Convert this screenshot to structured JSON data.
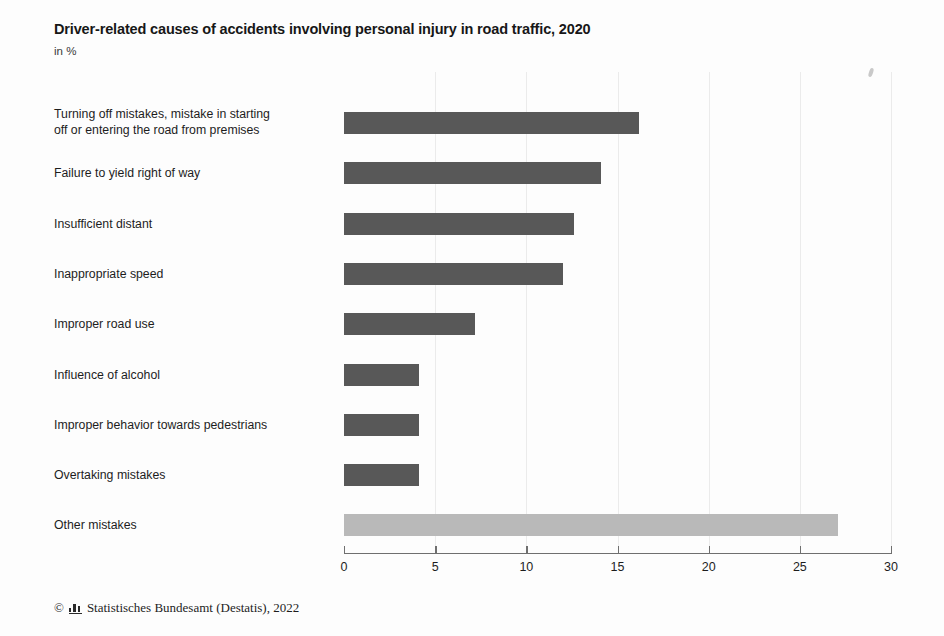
{
  "chart_data": {
    "type": "bar",
    "orientation": "horizontal",
    "title": "Driver-related causes of accidents involving personal injury in road traffic, 2020",
    "subtitle": "in %",
    "xlabel": "",
    "ylabel": "",
    "xlim": [
      0,
      30
    ],
    "xticks": [
      0,
      5,
      10,
      15,
      20,
      25,
      30
    ],
    "grid": true,
    "legend": "none",
    "categories": [
      "Turning off mistakes, mistake in starting off or entering the road from premises",
      "Failure to yield right of way",
      "Insufficient distant",
      "Inappropriate speed",
      "Improper road use",
      "Influence of alcohol",
      "Improper behavior towards pedestrians",
      "Overtaking mistakes",
      "Other mistakes"
    ],
    "values": [
      16.2,
      14.1,
      12.6,
      12.0,
      7.2,
      4.1,
      4.1,
      4.1,
      27.1
    ],
    "bar_colors": [
      "#585858",
      "#585858",
      "#585858",
      "#585858",
      "#585858",
      "#585858",
      "#585858",
      "#585858",
      "#b9b9b9"
    ]
  },
  "labels": {
    "line1": [
      "Turning off mistakes, mistake in starting",
      "Failure to yield right of way",
      "Insufficient distant",
      "Inappropriate speed",
      "Improper road use",
      "Influence of alcohol",
      "Improper behavior towards pedestrians",
      "Overtaking mistakes",
      "Other mistakes"
    ],
    "line2": [
      "off or entering the road from premises",
      "",
      "",
      "",
      "",
      "",
      "",
      "",
      ""
    ]
  },
  "axis": {
    "tick_labels": [
      "0",
      "5",
      "10",
      "15",
      "20",
      "25",
      "30"
    ]
  },
  "footer": {
    "copyright_symbol": "©",
    "logo_icon": "destatis-bar-logo-icon",
    "text": "Statistisches Bundesamt (Destatis), 2022"
  },
  "colors": {
    "bar_dark": "#585858",
    "bar_light": "#b9b9b9",
    "axis": "#6f6f6f",
    "grid": "#ebebeb",
    "text": "#1d1d1d",
    "background": "#fdfdfd"
  }
}
